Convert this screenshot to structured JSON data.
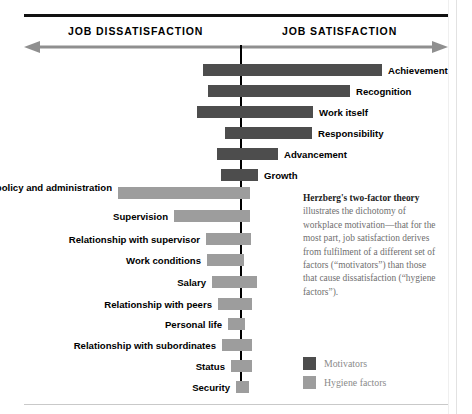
{
  "header": {
    "left_label": "JOB DISSATISFACTION",
    "right_label": "JOB SATISFACTION"
  },
  "description": {
    "lead": "Herzberg's two-factor theory",
    "body": " illustrates the dichotomy of workplace motivation—that for the most part, job satisfaction derives from fulfilment of a different set of factors (“motivators”) than those that cause dissatisfaction (“hygiene factors”)."
  },
  "legend": {
    "items": [
      {
        "label": "Motivators",
        "color": "#4d4d4d",
        "key": "motivator"
      },
      {
        "label": "Hygiene factors",
        "color": "#9d9d9d",
        "key": "hygiene"
      }
    ]
  },
  "colors": {
    "motivator": "#4d4d4d",
    "hygiene": "#9d9d9d",
    "axis": "#000000",
    "rule": "#111111"
  },
  "chart_data": {
    "type": "bar",
    "title": "Herzberg's two-factor theory",
    "orientation": "horizontal-diverging",
    "axis_center_label": "neutral",
    "xlabel": "",
    "ylabel": "",
    "axis_labels": [
      "JOB DISSATISFACTION",
      "JOB SATISFACTION"
    ],
    "legend_position": "bottom-right",
    "grid": false,
    "note": "Bar extents are read in pixel coordinates; center axis at x=240. dissatisfaction_extent = pixels left of axis, satisfaction_extent = pixels right of axis.",
    "series": [
      {
        "name": "Motivators",
        "color": "#4d4d4d",
        "items": [
          {
            "label": "Achievement",
            "x": 203,
            "w": 179,
            "dissatisfaction_extent": 37,
            "satisfaction_extent": 142,
            "label_side": "right"
          },
          {
            "label": "Recognition",
            "x": 208,
            "w": 142,
            "dissatisfaction_extent": 32,
            "satisfaction_extent": 110,
            "label_side": "right"
          },
          {
            "label": "Work itself",
            "x": 197,
            "w": 116,
            "dissatisfaction_extent": 43,
            "satisfaction_extent": 73,
            "label_side": "right"
          },
          {
            "label": "Responsibility",
            "x": 225,
            "w": 87,
            "dissatisfaction_extent": 15,
            "satisfaction_extent": 72,
            "label_side": "right"
          },
          {
            "label": "Advancement",
            "x": 217,
            "w": 61,
            "dissatisfaction_extent": 23,
            "satisfaction_extent": 38,
            "label_side": "right"
          },
          {
            "label": "Growth",
            "x": 221,
            "w": 37,
            "dissatisfaction_extent": 19,
            "satisfaction_extent": 18,
            "label_side": "right"
          }
        ]
      },
      {
        "name": "Hygiene factors",
        "color": "#9d9d9d",
        "items": [
          {
            "label": "Company policy and administration",
            "x": 118,
            "w": 132,
            "dissatisfaction_extent": 122,
            "satisfaction_extent": 10,
            "label_side": "left"
          },
          {
            "label": "Supervision",
            "x": 174,
            "w": 76,
            "dissatisfaction_extent": 66,
            "satisfaction_extent": 10,
            "label_side": "left"
          },
          {
            "label": "Relationship with supervisor",
            "x": 206,
            "w": 45,
            "dissatisfaction_extent": 34,
            "satisfaction_extent": 11,
            "label_side": "left"
          },
          {
            "label": "Work conditions",
            "x": 207,
            "w": 37,
            "dissatisfaction_extent": 33,
            "satisfaction_extent": 4,
            "label_side": "left"
          },
          {
            "label": "Salary",
            "x": 212,
            "w": 45,
            "dissatisfaction_extent": 28,
            "satisfaction_extent": 17,
            "label_side": "left"
          },
          {
            "label": "Relationship with peers",
            "x": 218,
            "w": 34,
            "dissatisfaction_extent": 22,
            "satisfaction_extent": 12,
            "label_side": "left"
          },
          {
            "label": "Personal life",
            "x": 228,
            "w": 17,
            "dissatisfaction_extent": 12,
            "satisfaction_extent": 5,
            "label_side": "left"
          },
          {
            "label": "Relationship with subordinates",
            "x": 222,
            "w": 30,
            "dissatisfaction_extent": 18,
            "satisfaction_extent": 12,
            "label_side": "left"
          },
          {
            "label": "Status",
            "x": 231,
            "w": 21,
            "dissatisfaction_extent": 9,
            "satisfaction_extent": 12,
            "label_side": "left"
          },
          {
            "label": "Security",
            "x": 236,
            "w": 13,
            "dissatisfaction_extent": 4,
            "satisfaction_extent": 9,
            "label_side": "left"
          }
        ]
      }
    ]
  },
  "layout": {
    "axis_x": 240,
    "bar_height": 12,
    "motivator_rows_y": [
      64,
      85,
      106,
      127,
      148,
      169
    ],
    "hygiene_rows_y": [
      187,
      210,
      233,
      254,
      276,
      298,
      318,
      339,
      360,
      381
    ],
    "label_gap": 6
  }
}
